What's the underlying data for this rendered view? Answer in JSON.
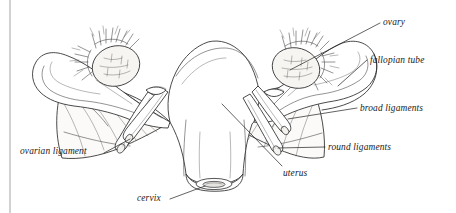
{
  "figure": {
    "background_color": "#ffffff",
    "ink_color": "#2b2b2b",
    "border": {
      "name": "left-page-rule",
      "color": "#9a9a9a",
      "orientation": "vertical",
      "x": 10
    }
  },
  "labels": {
    "ovary": "ovary",
    "fallopian_tube": "fallopian tube",
    "broad_ligaments": "broad ligaments",
    "round_ligaments": "round ligaments",
    "ovarian_ligament": "ovarian ligament",
    "uterus": "uterus",
    "cervix": "cervix"
  },
  "label_positions": {
    "ovary": {
      "x": 383,
      "y": 18
    },
    "fallopian_tube": {
      "x": 370,
      "y": 56
    },
    "broad_ligaments": {
      "x": 360,
      "y": 104
    },
    "round_ligaments": {
      "x": 328,
      "y": 143
    },
    "ovarian_ligament": {
      "x": 20,
      "y": 147
    },
    "uterus": {
      "x": 283,
      "y": 169
    },
    "cervix": {
      "x": 137,
      "y": 194
    }
  },
  "structures": [
    {
      "name": "uterus",
      "description": "central pear-shaped body with arching fundus"
    },
    {
      "name": "cervix",
      "description": "narrow neck with os opening at base of uterus"
    },
    {
      "name": "fallopian-tube-left",
      "description": "curving tube ending in fimbriae over left ovary"
    },
    {
      "name": "fallopian-tube-right",
      "description": "curving tube ending in fimbriae over right ovary"
    },
    {
      "name": "ovary-left",
      "description": "oval stippled gland beneath left fimbriae"
    },
    {
      "name": "ovary-right",
      "description": "oval stippled gland beneath right fimbriae"
    },
    {
      "name": "broad-ligament-left",
      "description": "draped fan-folded membrane"
    },
    {
      "name": "broad-ligament-right",
      "description": "draped fan-folded membrane"
    },
    {
      "name": "round-ligament-left",
      "description": "tubular cord crossing the broad ligament"
    },
    {
      "name": "round-ligament-right",
      "description": "tubular cord crossing the broad ligament"
    },
    {
      "name": "ovarian-ligament-left",
      "description": "short cord anchoring ovary to uterus"
    },
    {
      "name": "ovarian-ligament-right",
      "description": "short cord anchoring ovary to uterus"
    }
  ]
}
